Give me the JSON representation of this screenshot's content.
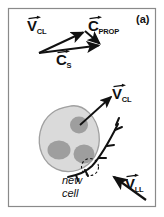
{
  "figure": {
    "panel_label": "(a)",
    "background_color": "#ffffff",
    "frame_color": "#8a8a8a",
    "ink_color": "#111111"
  },
  "vector_diagram": {
    "name": "velocity-vector-triangle",
    "vectors": [
      {
        "id": "v-cl-top",
        "symbol": "V",
        "subscript": "CL",
        "has_overarrow": true,
        "x1": 39,
        "y1": 53,
        "x2": 85,
        "y2": 31,
        "label_x": 29,
        "label_y": 19
      },
      {
        "id": "c-prop",
        "symbol": "C",
        "subscript": "PROP",
        "has_overarrow": true,
        "x1": 85,
        "y1": 31,
        "x2": 101,
        "y2": 45,
        "label_x": 89,
        "label_y": 19
      },
      {
        "id": "c-s",
        "symbol": "C",
        "subscript": "S",
        "has_overarrow": true,
        "x1": 39,
        "y1": 53,
        "x2": 101,
        "y2": 46,
        "label_x": 57,
        "label_y": 53
      }
    ]
  },
  "cell_diagram": {
    "name": "cell-schematic",
    "cell_body": {
      "fill": "#d9d9d9",
      "stroke": "#9a9a9a",
      "label": "cell-body"
    },
    "nuclei": [
      {
        "label": "nucleus-top",
        "cx": 79,
        "cy": 125,
        "rx": 9,
        "ry": 8,
        "fill": "#9e9e9e"
      },
      {
        "label": "nucleus-left",
        "cx": 59,
        "cy": 150,
        "rx": 11,
        "ry": 9,
        "fill": "#9e9e9e"
      },
      {
        "label": "nucleus-right",
        "cx": 84,
        "cy": 154,
        "rx": 10,
        "ry": 9,
        "fill": "#9e9e9e"
      }
    ],
    "v_cl_vector": {
      "id": "v-cl-bottom",
      "symbol": "V",
      "subscript": "CL",
      "has_overarrow": true,
      "x1": 80,
      "y1": 126,
      "x2": 113,
      "y2": 96,
      "label_x": 113,
      "label_y": 86
    },
    "v_ll_vector": {
      "id": "v-ll",
      "symbol": "V",
      "subscript": "LL",
      "has_overarrow": true,
      "x1": 145,
      "y1": 199,
      "x2": 113,
      "y2": 176,
      "label_x": 126,
      "label_y": 177
    },
    "new_cell_annotation": {
      "line1": "new",
      "line2": "cell",
      "x": 62,
      "y": 176
    },
    "branch_curve": {
      "label": "filament-curve",
      "stroke": "#111111"
    },
    "dashed_marker": {
      "label": "new-cell-marker",
      "cx": 90,
      "cy": 168,
      "r": 8,
      "stroke": "#111111"
    }
  }
}
